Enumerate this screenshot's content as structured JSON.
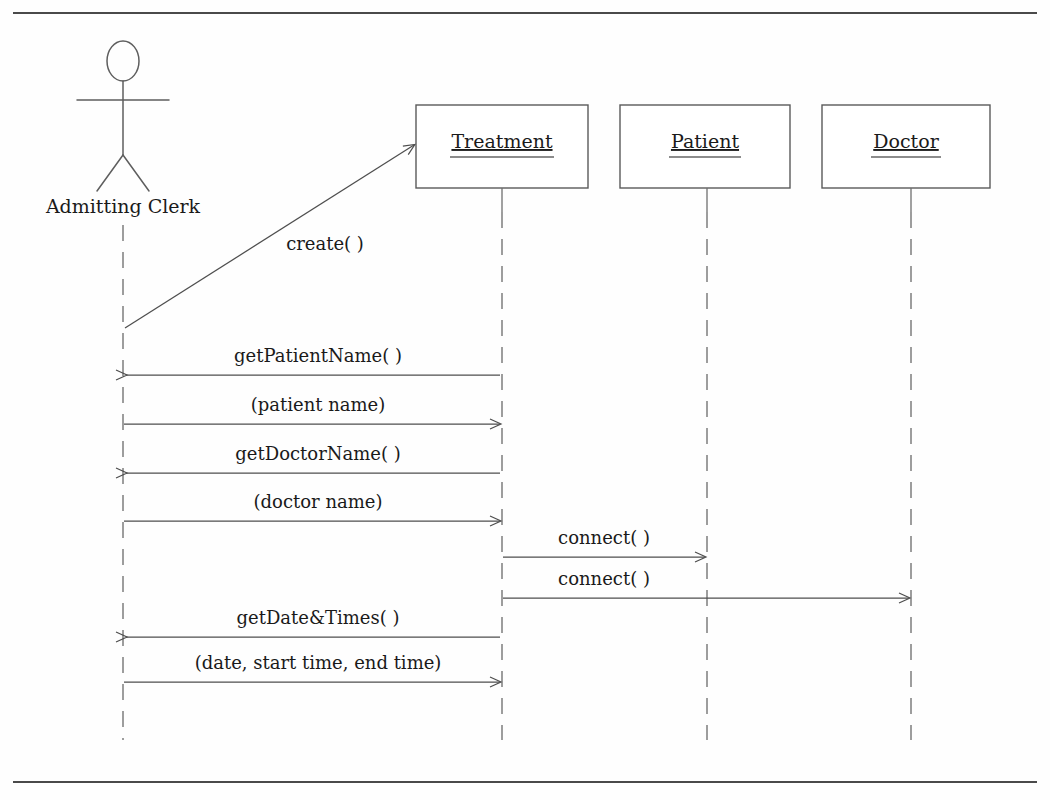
{
  "diagram": {
    "kind": "uml-sequence-diagram",
    "background_color": "#fefefe",
    "line_color": "#4e4e4e",
    "text_color": "#1a1a1a",
    "frame": {
      "top_rule_y": 13,
      "bottom_rule_y": 782,
      "rule_left_x": 13,
      "rule_right_x": 1037
    },
    "actor": {
      "label": "Admitting Clerk",
      "lifeline_x": 123,
      "label_y": 213,
      "head_cx": 123,
      "head_cy": 61,
      "head_rx": 16,
      "head_ry": 20,
      "arms_y": 100,
      "body_top_y": 81,
      "body_bottom_y": 155,
      "legs_y": 191,
      "leg_spread": 26,
      "lifeline_top_y": 225,
      "lifeline_bottom_y": 740
    },
    "objects": [
      {
        "name": "Treatment",
        "lifeline_x": 502,
        "box_x": 416,
        "box_y": 105,
        "box_w": 172,
        "box_h": 83,
        "label_y": 148,
        "underline_y": 157,
        "underline_half_w": 52,
        "lifeline_top_y": 188,
        "lifeline_bottom_y": 740
      },
      {
        "name": "Patient",
        "lifeline_x": 707,
        "box_x": 620,
        "box_y": 105,
        "box_w": 170,
        "box_h": 83,
        "label_y": 148,
        "underline_y": 157,
        "underline_half_w": 36,
        "lifeline_top_y": 188,
        "lifeline_bottom_y": 740
      },
      {
        "name": "Doctor",
        "lifeline_x": 911,
        "box_x": 822,
        "box_y": 105,
        "box_w": 168,
        "box_h": 83,
        "label_y": 148,
        "underline_y": 157,
        "underline_half_w": 35,
        "lifeline_top_y": 188,
        "lifeline_bottom_y": 740
      }
    ],
    "messages": [
      {
        "id": "msg-create",
        "label": "create( )",
        "from": "Admitting Clerk",
        "to": "Treatment",
        "direction": "right",
        "style": "diagonal",
        "x1": 125,
        "y1": 328,
        "x2": 414,
        "y2": 145,
        "label_x": 325,
        "label_y": 250
      },
      {
        "id": "msg-get-patient-name",
        "label": "getPatientName( )",
        "from": "Treatment",
        "to": "Admitting Clerk",
        "direction": "left",
        "style": "horizontal",
        "x1": 500,
        "y1": 375,
        "x2": 126,
        "y2": 375,
        "label_x": 318,
        "label_y": 362
      },
      {
        "id": "msg-patient-name",
        "label": "(patient name)",
        "from": "Admitting Clerk",
        "to": "Treatment",
        "direction": "right",
        "style": "horizontal",
        "x1": 124,
        "y1": 424,
        "x2": 500,
        "y2": 424,
        "label_x": 318,
        "label_y": 411
      },
      {
        "id": "msg-get-doctor-name",
        "label": "getDoctorName( )",
        "from": "Treatment",
        "to": "Admitting Clerk",
        "direction": "left",
        "style": "horizontal",
        "x1": 500,
        "y1": 473,
        "x2": 126,
        "y2": 473,
        "label_x": 318,
        "label_y": 460
      },
      {
        "id": "msg-doctor-name",
        "label": "(doctor name)",
        "from": "Admitting Clerk",
        "to": "Treatment",
        "direction": "right",
        "style": "horizontal",
        "x1": 124,
        "y1": 521,
        "x2": 500,
        "y2": 521,
        "label_x": 318,
        "label_y": 508
      },
      {
        "id": "msg-connect-patient",
        "label": "connect( )",
        "from": "Treatment",
        "to": "Patient",
        "direction": "right",
        "style": "horizontal",
        "x1": 503,
        "y1": 557,
        "x2": 705,
        "y2": 557,
        "label_x": 604,
        "label_y": 544
      },
      {
        "id": "msg-connect-doctor",
        "label": "connect( )",
        "from": "Treatment",
        "to": "Doctor",
        "direction": "right",
        "style": "horizontal",
        "x1": 503,
        "y1": 598,
        "x2": 909,
        "y2": 598,
        "label_x": 604,
        "label_y": 585
      },
      {
        "id": "msg-get-date-times",
        "label": "getDate&Times( )",
        "from": "Treatment",
        "to": "Admitting Clerk",
        "direction": "left",
        "style": "horizontal",
        "x1": 500,
        "y1": 637,
        "x2": 126,
        "y2": 637,
        "label_x": 318,
        "label_y": 624
      },
      {
        "id": "msg-date-start-end",
        "label": "(date, start time, end time)",
        "from": "Admitting Clerk",
        "to": "Treatment",
        "direction": "right",
        "style": "horizontal",
        "x1": 124,
        "y1": 682,
        "x2": 500,
        "y2": 682,
        "label_x": 318,
        "label_y": 669
      }
    ]
  }
}
